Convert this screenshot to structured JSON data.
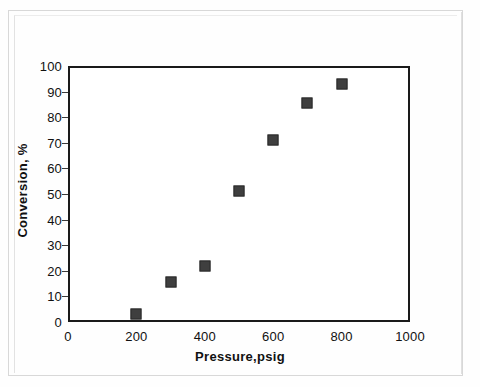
{
  "chart_data": {
    "type": "scatter",
    "title": "",
    "xlabel": "Pressure,psig",
    "ylabel": "Conversion, %",
    "xlim": [
      0,
      1000
    ],
    "ylim": [
      0,
      100
    ],
    "xticks": [
      0,
      200,
      400,
      600,
      800,
      1000
    ],
    "yticks": [
      0,
      10,
      20,
      30,
      40,
      50,
      60,
      70,
      80,
      90,
      100
    ],
    "grid": false,
    "legend": false,
    "marker": "filled-square",
    "marker_color": "#3f3f3f",
    "series": [
      {
        "name": "Conversion vs Pressure",
        "points": [
          {
            "x": 200,
            "y": 3
          },
          {
            "x": 300,
            "y": 15.5
          },
          {
            "x": 400,
            "y": 22
          },
          {
            "x": 500,
            "y": 51
          },
          {
            "x": 600,
            "y": 71
          },
          {
            "x": 700,
            "y": 85.5
          },
          {
            "x": 800,
            "y": 93
          }
        ]
      }
    ]
  },
  "axes": {
    "y_tick_labels": [
      "100",
      "90",
      "80",
      "70",
      "60",
      "50",
      "40",
      "30",
      "20",
      "10",
      "0"
    ],
    "x_tick_labels": [
      "0",
      "200",
      "400",
      "600",
      "800",
      "1000"
    ],
    "x_title": "Pressure,psig",
    "y_title": "Conversion, %"
  },
  "colors": {
    "axis": "#1a1a1a",
    "marker": "#3f3f3f",
    "text": "#111111",
    "page": "#ffffff"
  }
}
